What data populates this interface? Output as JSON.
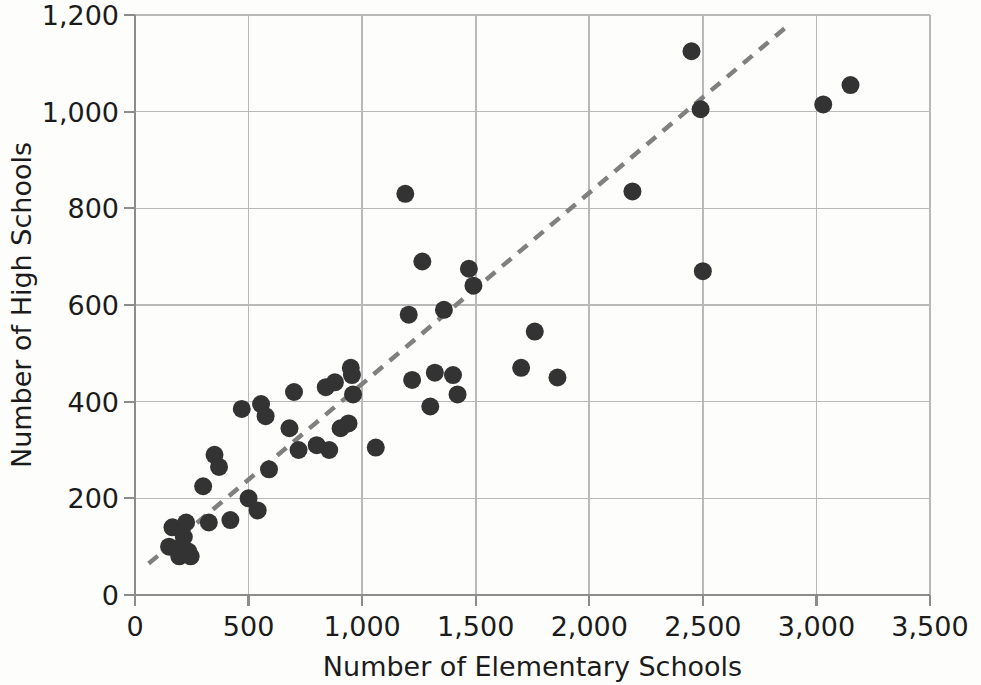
{
  "chart_data": {
    "type": "scatter",
    "title": "",
    "xlabel": "Number of Elementary Schools",
    "ylabel": "Number of High Schools",
    "xlim": [
      0,
      3500
    ],
    "ylim": [
      0,
      1200
    ],
    "xticks": [
      "0",
      "500",
      "1,000",
      "1,500",
      "2,000",
      "2,500",
      "3,000",
      "3,500"
    ],
    "xtick_values": [
      0,
      500,
      1000,
      1500,
      2000,
      2500,
      3000,
      3500
    ],
    "yticks": [
      "0",
      "200",
      "400",
      "600",
      "800",
      "1,000",
      "1,200"
    ],
    "ytick_values": [
      0,
      200,
      400,
      600,
      800,
      1000,
      1200
    ],
    "grid": true,
    "legend": "none",
    "marker_color": "#333333",
    "marker_size": 9,
    "grid_color": "#b9b9b9",
    "axis_color": "#8c8c8c",
    "background_color": "#fdfdfb",
    "points": [
      [
        150,
        100
      ],
      [
        165,
        140
      ],
      [
        185,
        95
      ],
      [
        195,
        80
      ],
      [
        205,
        85
      ],
      [
        215,
        120
      ],
      [
        225,
        150
      ],
      [
        235,
        90
      ],
      [
        245,
        80
      ],
      [
        300,
        225
      ],
      [
        325,
        150
      ],
      [
        350,
        290
      ],
      [
        370,
        265
      ],
      [
        420,
        155
      ],
      [
        470,
        385
      ],
      [
        500,
        200
      ],
      [
        540,
        175
      ],
      [
        555,
        395
      ],
      [
        575,
        370
      ],
      [
        590,
        260
      ],
      [
        680,
        345
      ],
      [
        700,
        420
      ],
      [
        720,
        300
      ],
      [
        800,
        310
      ],
      [
        840,
        430
      ],
      [
        855,
        300
      ],
      [
        880,
        440
      ],
      [
        905,
        345
      ],
      [
        940,
        355
      ],
      [
        950,
        470
      ],
      [
        955,
        455
      ],
      [
        960,
        415
      ],
      [
        1060,
        305
      ],
      [
        1190,
        830
      ],
      [
        1205,
        580
      ],
      [
        1220,
        445
      ],
      [
        1265,
        690
      ],
      [
        1300,
        390
      ],
      [
        1320,
        460
      ],
      [
        1360,
        590
      ],
      [
        1400,
        455
      ],
      [
        1420,
        415
      ],
      [
        1470,
        675
      ],
      [
        1490,
        640
      ],
      [
        1700,
        470
      ],
      [
        1760,
        545
      ],
      [
        1860,
        450
      ],
      [
        2190,
        835
      ],
      [
        2450,
        1125
      ],
      [
        2490,
        1005
      ],
      [
        2500,
        670
      ],
      [
        3030,
        1015
      ],
      [
        3150,
        1055
      ]
    ],
    "trendline": {
      "style": "dashed",
      "color": "#808080",
      "x_start": 60,
      "y_start": 65,
      "x_end": 2880,
      "y_end": 1180
    }
  }
}
